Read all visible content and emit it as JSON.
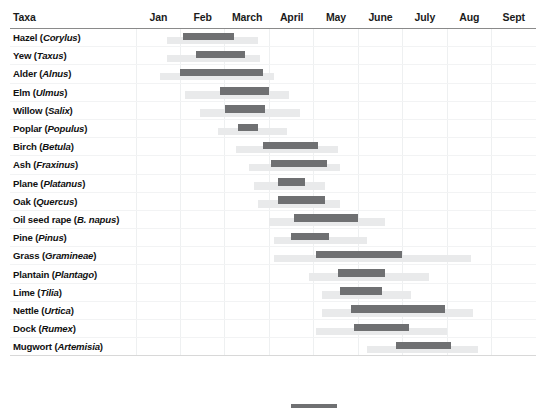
{
  "chart_data": {
    "type": "bar",
    "title": "",
    "subtitle": "",
    "xlabel": "",
    "ylabel": "Taxa",
    "grid": true,
    "legend_position": "bottom",
    "axis_months": [
      "Jan",
      "Feb",
      "March",
      "April",
      "May",
      "June",
      "July",
      "Aug",
      "Sept"
    ],
    "x_range_months": [
      1,
      10
    ],
    "value_unit": "month (1 = Jan 1, 10 = Oct 1)",
    "series": [
      {
        "name": "Peak season",
        "color": "#6f7072"
      },
      {
        "name": "Extended season",
        "color": "#e9eaeb"
      }
    ],
    "categories": [
      "Hazel (Corylus)",
      "Yew (Taxus)",
      "Alder (Alnus)",
      "Elm (Ulmus)",
      "Willow (Salix)",
      "Poplar (Populus)",
      "Birch (Betula)",
      "Ash (Fraxinus)",
      "Plane (Platanus)",
      "Oak (Quercus)",
      "Oil seed rape (B. napus)",
      "Pine (Pinus)",
      "Grass (Gramineae)",
      "Plantain (Plantago)",
      "Lime (Tilia)",
      "Nettle (Urtica)",
      "Dock (Rumex)",
      "Mugwort (Artemisia)"
    ],
    "rows": [
      {
        "taxon_common": "Hazel",
        "taxon_latin": "Corylus",
        "peak_start": 2.05,
        "peak_end": 3.2,
        "ext_start": 1.7,
        "ext_end": 3.75
      },
      {
        "taxon_common": "Yew",
        "taxon_latin": "Taxus",
        "peak_start": 2.35,
        "peak_end": 3.45,
        "ext_start": 1.7,
        "ext_end": 3.8
      },
      {
        "taxon_common": "Alder",
        "taxon_latin": "Alnus",
        "peak_start": 2.0,
        "peak_end": 3.85,
        "ext_start": 1.55,
        "ext_end": 4.1
      },
      {
        "taxon_common": "Elm",
        "taxon_latin": "Ulmus",
        "peak_start": 2.9,
        "peak_end": 4.0,
        "ext_start": 2.1,
        "ext_end": 4.45
      },
      {
        "taxon_common": "Willow",
        "taxon_latin": "Salix",
        "peak_start": 3.0,
        "peak_end": 3.9,
        "ext_start": 2.45,
        "ext_end": 4.7
      },
      {
        "taxon_common": "Poplar",
        "taxon_latin": "Populus",
        "peak_start": 3.3,
        "peak_end": 3.75,
        "ext_start": 2.85,
        "ext_end": 4.4
      },
      {
        "taxon_common": "Birch",
        "taxon_latin": "Betula",
        "peak_start": 3.85,
        "peak_end": 5.1,
        "ext_start": 3.25,
        "ext_end": 5.55
      },
      {
        "taxon_common": "Ash",
        "taxon_latin": "Fraxinus",
        "peak_start": 4.05,
        "peak_end": 5.3,
        "ext_start": 3.55,
        "ext_end": 5.6
      },
      {
        "taxon_common": "Plane",
        "taxon_latin": "Platanus",
        "peak_start": 4.2,
        "peak_end": 4.8,
        "ext_start": 3.65,
        "ext_end": 5.25
      },
      {
        "taxon_common": "Oak",
        "taxon_latin": "Quercus",
        "peak_start": 4.2,
        "peak_end": 5.25,
        "ext_start": 3.75,
        "ext_end": 5.6
      },
      {
        "taxon_common": "Oil seed rape",
        "taxon_latin": "B. napus",
        "peak_start": 4.55,
        "peak_end": 6.0,
        "ext_start": 4.0,
        "ext_end": 6.6
      },
      {
        "taxon_common": "Pine",
        "taxon_latin": "Pinus",
        "peak_start": 4.5,
        "peak_end": 5.35,
        "ext_start": 4.1,
        "ext_end": 6.2
      },
      {
        "taxon_common": "Grass",
        "taxon_latin": "Gramineae",
        "peak_start": 5.05,
        "peak_end": 7.0,
        "ext_start": 4.1,
        "ext_end": 8.55
      },
      {
        "taxon_common": "Plantain",
        "taxon_latin": "Plantago",
        "peak_start": 5.55,
        "peak_end": 6.6,
        "ext_start": 4.9,
        "ext_end": 7.6
      },
      {
        "taxon_common": "Lime",
        "taxon_latin": "Tilia",
        "peak_start": 5.6,
        "peak_end": 6.55,
        "ext_start": 5.2,
        "ext_end": 7.2
      },
      {
        "taxon_common": "Nettle",
        "taxon_latin": "Urtica",
        "peak_start": 5.85,
        "peak_end": 7.95,
        "ext_start": 5.2,
        "ext_end": 8.6
      },
      {
        "taxon_common": "Dock",
        "taxon_latin": "Rumex",
        "peak_start": 5.9,
        "peak_end": 7.15,
        "ext_start": 5.05,
        "ext_end": 8.0
      },
      {
        "taxon_common": "Mugwort",
        "taxon_latin": "Artemisia",
        "peak_start": 6.85,
        "peak_end": 8.1,
        "ext_start": 6.2,
        "ext_end": 8.7
      }
    ]
  },
  "header": {
    "taxa_label": "Taxa",
    "months": [
      "Jan",
      "Feb",
      "March",
      "April",
      "May",
      "June",
      "July",
      "Aug",
      "Sept"
    ]
  },
  "legend": {
    "swatch_color": "#6f7072",
    "label": ""
  },
  "colors": {
    "peak": "#6f7072",
    "extended": "#e9eaeb",
    "grid": "#eef0f1",
    "header_rule": "#8a8a8a",
    "text": "#111111",
    "background": "#ffffff"
  }
}
